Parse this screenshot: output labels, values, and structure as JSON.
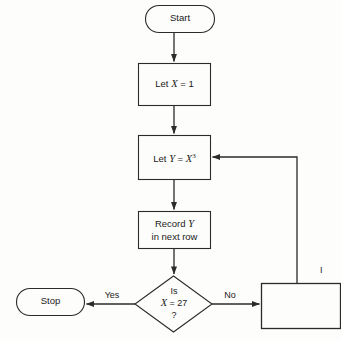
{
  "diagram": {
    "type": "flowchart",
    "background_color": "#fdfdfb",
    "stroke_color": "#2b2b2b",
    "text_color": "#1a1a1a"
  },
  "nodes": {
    "start": {
      "label": "Start",
      "shape": "terminator"
    },
    "let_x": {
      "label_prefix": "Let ",
      "label_var": "X",
      "label_suffix": " = 1",
      "shape": "process"
    },
    "let_y": {
      "label_prefix": "Let ",
      "label_var": "Y",
      "label_eq": " = ",
      "label_expr_base": "X",
      "label_expr_exp": "3",
      "shape": "process"
    },
    "record": {
      "line1_prefix": "Record ",
      "line1_var": "Y",
      "line2": "in next row",
      "shape": "process"
    },
    "decision": {
      "line1": "Is",
      "line2_var": "X",
      "line2_rest": " = 27",
      "line3": "?",
      "shape": "decision"
    },
    "stop": {
      "label": "Stop",
      "shape": "terminator"
    },
    "increment": {
      "label": "",
      "clipped_label": "I",
      "shape": "process"
    }
  },
  "edges": {
    "yes_label": "Yes",
    "no_label": "No"
  }
}
